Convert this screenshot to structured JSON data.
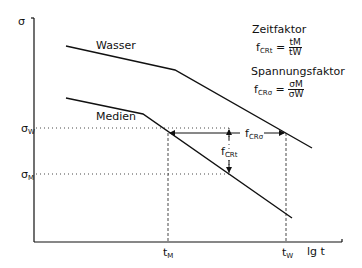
{
  "diagram": {
    "axes": {
      "y_label": "σ",
      "x_label": "lg t",
      "y_ticks": [
        {
          "main": "σ",
          "sub": "W",
          "y": 128
        },
        {
          "main": "σ",
          "sub": "M",
          "y": 174
        }
      ],
      "x_ticks": [
        {
          "main": "t",
          "sub": "M",
          "x": 168
        },
        {
          "main": "t",
          "sub": "W",
          "x": 286
        }
      ]
    },
    "curves": [
      {
        "name": "Wasser",
        "label": "Wasser",
        "points": [
          [
            66,
            46
          ],
          [
            175,
            70
          ],
          [
            312,
            148
          ]
        ]
      },
      {
        "name": "Medien",
        "label": "Medien",
        "points": [
          [
            66,
            98
          ],
          [
            143,
            114
          ],
          [
            292,
            218
          ]
        ]
      }
    ],
    "annotations": {
      "f_cr_sigma": {
        "main": "f",
        "sub": "CRσ"
      },
      "f_cr_t": {
        "main": "f",
        "sub": "CRt"
      }
    },
    "legend": {
      "time_factor_title": "Zeitfaktor",
      "time_factor_lhs_main": "f",
      "time_factor_lhs_sub": "CRt",
      "time_factor_num": "tM",
      "time_factor_den": "tW",
      "stress_factor_title": "Spannungsfaktor",
      "stress_factor_lhs_main": "f",
      "stress_factor_lhs_sub": "CRσ",
      "stress_factor_num": "σM",
      "stress_factor_den": "σW",
      "equals": "="
    }
  }
}
